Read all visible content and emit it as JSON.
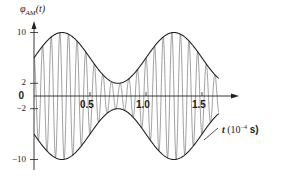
{
  "chart_data": {
    "type": "line",
    "title": "",
    "ylabel": "φ_AM(t)",
    "xlabel": "t (10^-4 s)",
    "xlabel_parts": {
      "var": "t",
      "unit_prefix": "(10",
      "exp": "−4",
      "unit": " s)"
    },
    "y_ticks": [
      {
        "value": 10,
        "label": "10"
      },
      {
        "value": 2,
        "label": "2"
      },
      {
        "value": 0,
        "label": "0"
      },
      {
        "value": -2,
        "label": "−2"
      },
      {
        "value": -10,
        "label": "−10"
      }
    ],
    "x_ticks": [
      {
        "value": 0.5,
        "label": "0.5"
      },
      {
        "value": 1.0,
        "label": "1.0"
      },
      {
        "value": 1.5,
        "label": "1.5"
      }
    ],
    "xlim": [
      0,
      1.65
    ],
    "ylim": [
      -10,
      10
    ],
    "grid": false,
    "legend": null,
    "series": [
      {
        "name": "upper envelope",
        "formula": "6 + 4 sin(2πt)",
        "style": "dark"
      },
      {
        "name": "lower envelope",
        "formula": "-(6 + 4 sin(2πt))",
        "style": "dark"
      },
      {
        "name": "AM signal",
        "formula": "(6 + 4 sin(2πt)) cos(2π·13t)",
        "style": "gray",
        "carrier_cycles_per_unit": 13
      }
    ],
    "envelope": {
      "max": 10,
      "min": 2,
      "offset": 6,
      "amplitude": 4,
      "peaks_at": [
        0.25,
        1.25
      ],
      "min_at": [
        0.75
      ]
    }
  },
  "labels": {
    "ylabel_main": "φ",
    "ylabel_sub": "AM",
    "ylabel_arg": "(t)"
  }
}
